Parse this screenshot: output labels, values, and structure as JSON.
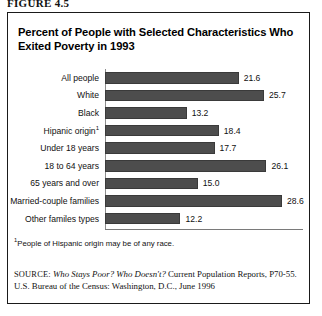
{
  "figure_label": "FIGURE 4.5",
  "panel": {
    "title": "Percent of People with Selected Characteristics Who Exited Poverty in 1993",
    "footnote_marker": "1",
    "footnote_text": "People of Hispanic origin may be of any race.",
    "source": {
      "kicker": "SOURCE:",
      "italic_title": "Who Stays Poor? Who Doesn't?",
      "rest": " Current Population Reports, P70-55. U.S. Bureau of the Census: Washington, D.C., June 1996"
    }
  },
  "colors": {
    "bar_fill": "#4d4d4d",
    "frame": "#1a1a1a",
    "text": "#111111",
    "axis": "#7a7a7a"
  },
  "chart_data": {
    "type": "bar",
    "orientation": "horizontal",
    "title": "Percent of People with Selected Characteristics Who Exited Poverty in 1993",
    "xlabel": "",
    "ylabel": "",
    "xlim": [
      0,
      32
    ],
    "grid": false,
    "legend": false,
    "value_labels": true,
    "units": "percent",
    "categories": [
      "All people",
      "White",
      "Black",
      "Hipanic origin",
      "Under 18 years",
      "18 to 64 years",
      "65 years and over",
      "Married-couple families",
      "Other familes types"
    ],
    "values": [
      21.6,
      25.7,
      13.2,
      18.4,
      17.7,
      26.1,
      15.0,
      28.6,
      12.2
    ],
    "bars": [
      {
        "label": "All people",
        "footnote": "",
        "value": 21.6,
        "value_text": "21.6"
      },
      {
        "label": "White",
        "footnote": "",
        "value": 25.7,
        "value_text": "25.7"
      },
      {
        "label": "Black",
        "footnote": "",
        "value": 13.2,
        "value_text": "13.2"
      },
      {
        "label": "Hipanic origin",
        "footnote": "1",
        "value": 18.4,
        "value_text": "18.4"
      },
      {
        "label": "Under 18 years",
        "footnote": "",
        "value": 17.7,
        "value_text": "17.7"
      },
      {
        "label": "18 to 64 years",
        "footnote": "",
        "value": 26.1,
        "value_text": "26.1"
      },
      {
        "label": "65 years and over",
        "footnote": "",
        "value": 15.0,
        "value_text": "15.0"
      },
      {
        "label": "Married-couple families",
        "footnote": "",
        "value": 28.6,
        "value_text": "28.6"
      },
      {
        "label": "Other familes types",
        "footnote": "",
        "value": 12.2,
        "value_text": "12.2"
      }
    ]
  }
}
